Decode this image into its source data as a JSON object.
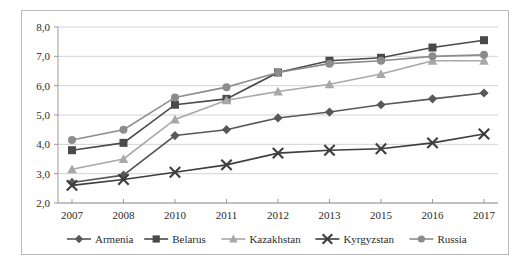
{
  "chart_data": {
    "type": "line",
    "title": "",
    "subtitle": "",
    "xlabel": "",
    "ylabel": "",
    "categories": [
      "2007",
      "2008",
      "2010",
      "2011",
      "2012",
      "2013",
      "2015",
      "2016",
      "2017"
    ],
    "x_tick_labels": [
      "2007",
      "2008",
      "2010",
      "2011",
      "2012",
      "2013",
      "2015",
      "2016",
      "2017"
    ],
    "y_tick_labels": [
      "2,0",
      "3,0",
      "4,0",
      "5,0",
      "6,0",
      "7,0",
      "8,0"
    ],
    "y_tick_values": [
      2.0,
      3.0,
      4.0,
      5.0,
      6.0,
      7.0,
      8.0
    ],
    "ylim": [
      2.0,
      8.0
    ],
    "grid": true,
    "grid_axis": "y",
    "legend_position": "bottom",
    "series": [
      {
        "name": "Armenia",
        "marker": "diamond",
        "color": "#585858",
        "values": [
          2.7,
          2.95,
          4.3,
          4.5,
          4.9,
          5.1,
          5.35,
          5.55,
          5.75
        ]
      },
      {
        "name": "Belarus",
        "marker": "square",
        "color": "#4a4a4a",
        "values": [
          3.8,
          4.05,
          5.35,
          5.55,
          6.45,
          6.85,
          6.95,
          7.3,
          7.55
        ]
      },
      {
        "name": "Kazakhstan",
        "marker": "triangle",
        "color": "#a8a8a8",
        "values": [
          3.15,
          3.5,
          4.85,
          5.5,
          5.8,
          6.05,
          6.4,
          6.85,
          6.85
        ]
      },
      {
        "name": "Kyrgyzstan",
        "marker": "cross",
        "color": "#3d3d3d",
        "values": [
          2.6,
          2.8,
          3.05,
          3.3,
          3.7,
          3.8,
          3.85,
          4.05,
          4.35
        ]
      },
      {
        "name": "Russia",
        "marker": "circle",
        "color": "#8c8c8c",
        "values": [
          4.15,
          4.5,
          5.6,
          5.95,
          6.45,
          6.75,
          6.85,
          7.0,
          7.05
        ]
      }
    ]
  }
}
